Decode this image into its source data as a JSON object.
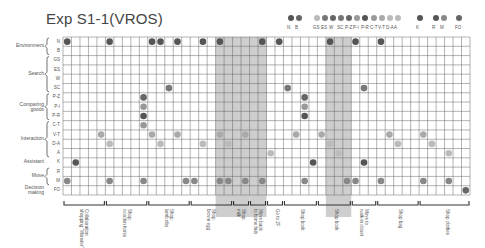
{
  "title": "Exp S1-1(VROS)",
  "legend": [
    {
      "group": "Environment",
      "items": [
        {
          "code": "N",
          "color": "#555555"
        },
        {
          "code": "B",
          "color": "#666666"
        }
      ]
    },
    {
      "group": "Search",
      "items": [
        {
          "code": "GS",
          "color": "#bbbbbb"
        },
        {
          "code": "ES",
          "color": "#777777"
        },
        {
          "code": "W",
          "color": "#666666"
        },
        {
          "code": "SC",
          "color": "#777777"
        }
      ]
    },
    {
      "group": "Comparing goods",
      "items": [
        {
          "code": "P-Z",
          "color": "#666666"
        },
        {
          "code": "P-I",
          "color": "#999999"
        },
        {
          "code": "P-R",
          "color": "#555555"
        }
      ]
    },
    {
      "group": "Interaction",
      "items": [
        {
          "code": "C-T",
          "color": "#999999"
        },
        {
          "code": "V-T",
          "color": "#aaaaaa"
        },
        {
          "code": "D-A",
          "color": "#bbbbbb"
        },
        {
          "code": "A",
          "color": "#bbbbbb"
        }
      ]
    },
    {
      "group": "Assistant",
      "items": [
        {
          "code": "K",
          "color": "#555555"
        }
      ]
    },
    {
      "group": "Move",
      "items": [
        {
          "code": "R",
          "color": "#555555"
        },
        {
          "code": "M",
          "color": "#888888"
        }
      ]
    },
    {
      "group": "Decision making",
      "items": [
        {
          "code": "FO",
          "color": "#666666"
        }
      ]
    }
  ],
  "chart_data": {
    "type": "scatter",
    "title": "Exp S1-1(VROS)",
    "xlabel": "",
    "ylabel": "",
    "grid": true,
    "legend_position": "top-right",
    "n_columns": 48,
    "rows": [
      "N",
      "B",
      "GS",
      "ES",
      "W",
      "SC",
      "P-Z",
      "P-I",
      "P-R",
      "C-T",
      "V-T",
      "D-A",
      "A",
      "K",
      "R",
      "M",
      "FO"
    ],
    "row_groups": [
      {
        "label": "Environment",
        "rows": [
          "N",
          "B"
        ]
      },
      {
        "label": "Search",
        "rows": [
          "GS",
          "ES",
          "W",
          "SC"
        ]
      },
      {
        "label": "Comparing goods",
        "rows": [
          "P-Z",
          "P-I",
          "P-R"
        ]
      },
      {
        "label": "Interaction",
        "rows": [
          "C-T",
          "V-T",
          "D-A",
          "A"
        ]
      },
      {
        "label": "Assistant",
        "rows": [
          "K"
        ]
      },
      {
        "label": "Move",
        "rows": [
          "R",
          "M"
        ]
      },
      {
        "label": "Decision making",
        "rows": [
          "FO"
        ]
      }
    ],
    "shaded_columns": [
      [
        18,
        21
      ],
      [
        22,
        23
      ],
      [
        31,
        33
      ]
    ],
    "points": [
      {
        "col": 0,
        "row": "N"
      },
      {
        "col": 5,
        "row": "N"
      },
      {
        "col": 10,
        "row": "N"
      },
      {
        "col": 11,
        "row": "N"
      },
      {
        "col": 13,
        "row": "N"
      },
      {
        "col": 16,
        "row": "N"
      },
      {
        "col": 18,
        "row": "N"
      },
      {
        "col": 23,
        "row": "N"
      },
      {
        "col": 25,
        "row": "N"
      },
      {
        "col": 31,
        "row": "N"
      },
      {
        "col": 34,
        "row": "N"
      },
      {
        "col": 37,
        "row": "N"
      },
      {
        "col": 12,
        "row": "SC"
      },
      {
        "col": 26,
        "row": "SC"
      },
      {
        "col": 35,
        "row": "SC"
      },
      {
        "col": 9,
        "row": "P-Z"
      },
      {
        "col": 9,
        "row": "P-I"
      },
      {
        "col": 9,
        "row": "P-R"
      },
      {
        "col": 28,
        "row": "P-Z"
      },
      {
        "col": 28,
        "row": "P-I"
      },
      {
        "col": 28,
        "row": "P-R"
      },
      {
        "col": 9,
        "row": "C-T"
      },
      {
        "col": 4,
        "row": "V-T"
      },
      {
        "col": 10,
        "row": "V-T"
      },
      {
        "col": 13,
        "row": "V-T"
      },
      {
        "col": 18,
        "row": "V-T"
      },
      {
        "col": 21,
        "row": "V-T"
      },
      {
        "col": 27,
        "row": "V-T"
      },
      {
        "col": 30,
        "row": "V-T"
      },
      {
        "col": 38,
        "row": "V-T"
      },
      {
        "col": 42,
        "row": "V-T"
      },
      {
        "col": 5,
        "row": "D-A"
      },
      {
        "col": 11,
        "row": "D-A"
      },
      {
        "col": 16,
        "row": "D-A"
      },
      {
        "col": 19,
        "row": "D-A"
      },
      {
        "col": 31,
        "row": "D-A"
      },
      {
        "col": 39,
        "row": "D-A"
      },
      {
        "col": 43,
        "row": "D-A"
      },
      {
        "col": 24,
        "row": "A"
      },
      {
        "col": 32,
        "row": "A"
      },
      {
        "col": 45,
        "row": "A"
      },
      {
        "col": 1,
        "row": "K"
      },
      {
        "col": 29,
        "row": "K"
      },
      {
        "col": 35,
        "row": "K"
      },
      {
        "col": 0,
        "row": "M"
      },
      {
        "col": 5,
        "row": "M"
      },
      {
        "col": 9,
        "row": "M"
      },
      {
        "col": 14,
        "row": "M"
      },
      {
        "col": 15,
        "row": "M"
      },
      {
        "col": 18,
        "row": "M"
      },
      {
        "col": 19,
        "row": "M"
      },
      {
        "col": 21,
        "row": "M"
      },
      {
        "col": 23,
        "row": "M"
      },
      {
        "col": 28,
        "row": "M"
      },
      {
        "col": 33,
        "row": "M"
      },
      {
        "col": 34,
        "row": "M"
      },
      {
        "col": 37,
        "row": "M"
      },
      {
        "col": 42,
        "row": "M"
      },
      {
        "col": 45,
        "row": "M"
      },
      {
        "col": 47,
        "row": "FO"
      }
    ],
    "tasks": [
      {
        "label": "Collaboration:\nshopping \"Monster\"",
        "start": 0,
        "end": 5
      },
      {
        "label": "Shop:\nwooden horse",
        "start": 5,
        "end": 10
      },
      {
        "label": "Shop:\nlamb ribs",
        "start": 10,
        "end": 15
      },
      {
        "label": "Shop:\nbrown egg",
        "start": 15,
        "end": 20
      },
      {
        "label": "Shop:\nmilk",
        "start": 20,
        "end": 22
      },
      {
        "label": "Move back\nto home hub",
        "start": 22,
        "end": 24
      },
      {
        "label": "Go to 2F",
        "start": 24,
        "end": 26
      },
      {
        "label": "Shop book",
        "start": 26,
        "end": 30
      },
      {
        "label": "Shop book",
        "start": 30,
        "end": 34
      },
      {
        "label": "Move to\nwalk-in closet",
        "start": 34,
        "end": 37
      },
      {
        "label": "Shop bag",
        "start": 37,
        "end": 42
      },
      {
        "label": "Shop clothes",
        "start": 42,
        "end": 48
      }
    ]
  }
}
